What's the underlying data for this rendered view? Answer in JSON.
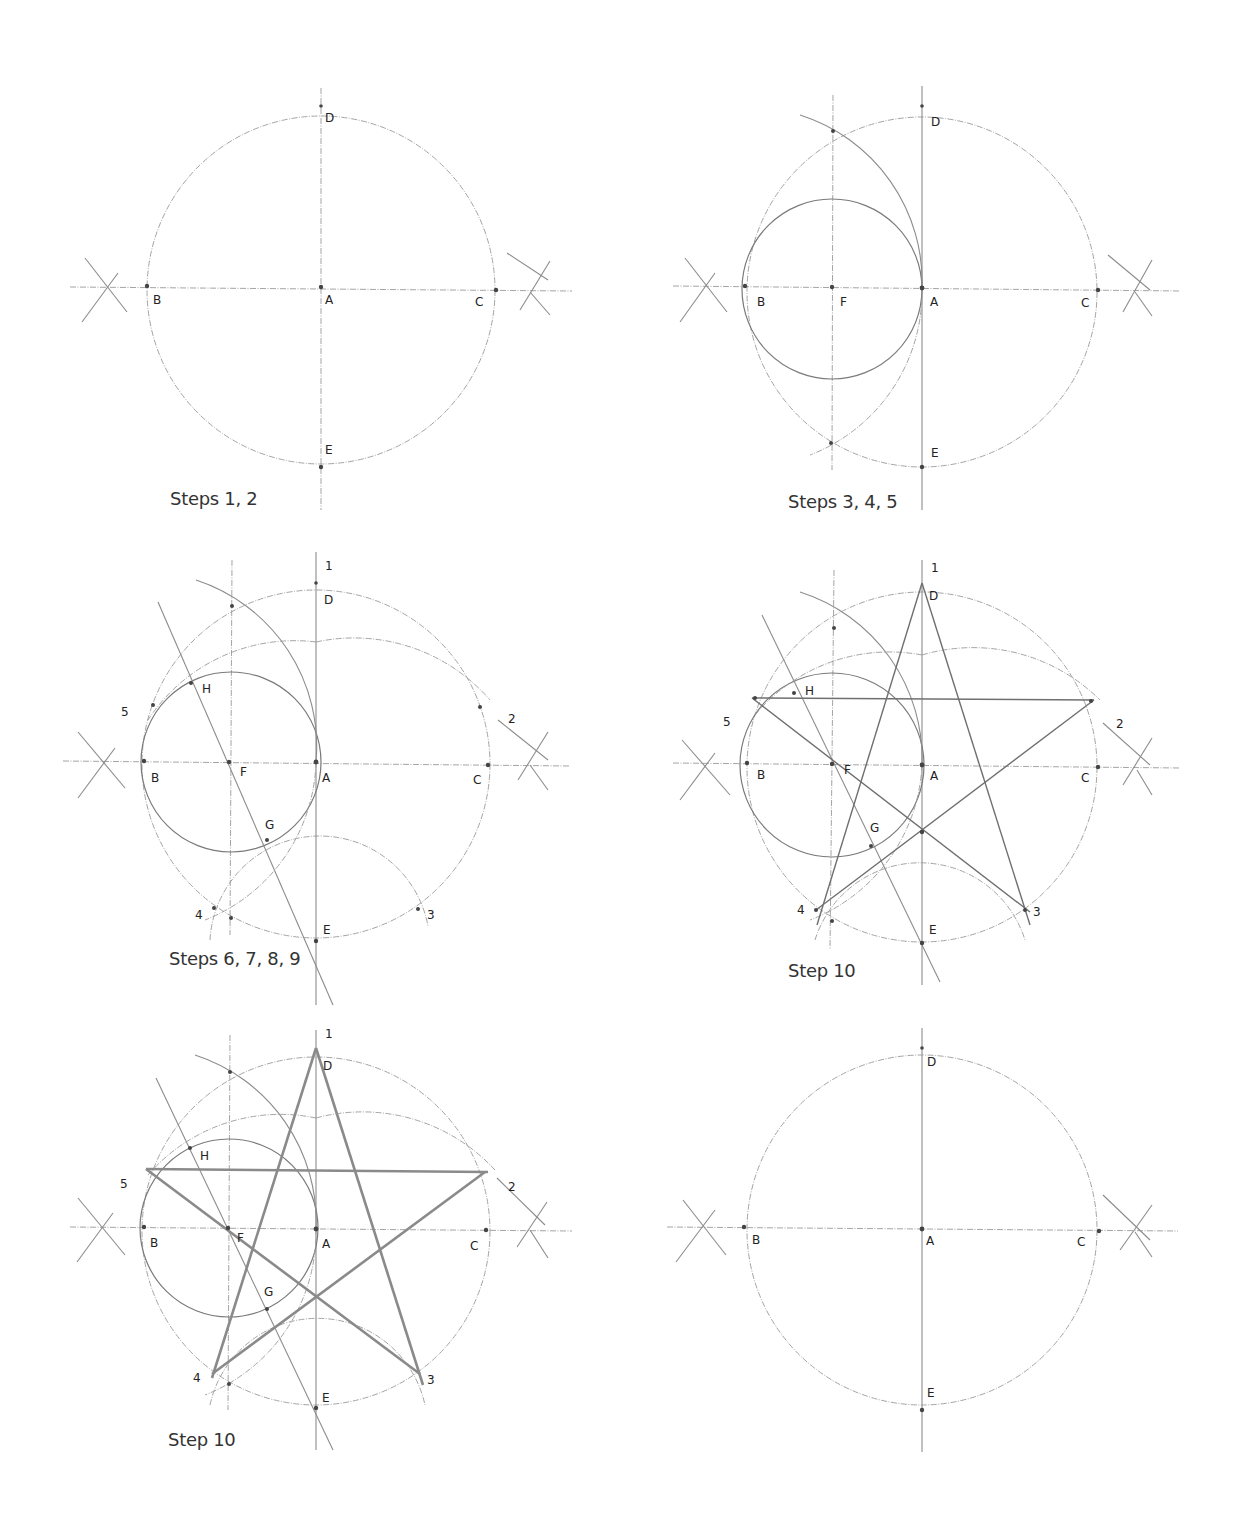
{
  "figure": {
    "panels": [
      {
        "id": "p1",
        "caption": "Steps 1, 2",
        "labels": {
          "A": "A",
          "B": "B",
          "C": "C",
          "D": "D",
          "E": "E"
        }
      },
      {
        "id": "p2",
        "caption": "Steps 3, 4, 5",
        "labels": {
          "A": "A",
          "B": "B",
          "C": "C",
          "D": "D",
          "E": "E",
          "F": "F"
        }
      },
      {
        "id": "p3",
        "caption": "Steps 6, 7, 8, 9",
        "labels": {
          "A": "A",
          "B": "B",
          "C": "C",
          "D": "D",
          "E": "E",
          "F": "F",
          "G": "G",
          "H": "H",
          "n1": "1",
          "n2": "2",
          "n3": "3",
          "n4": "4",
          "n5": "5"
        }
      },
      {
        "id": "p4",
        "caption": "Step 10",
        "labels": {
          "A": "A",
          "B": "B",
          "C": "C",
          "D": "D",
          "E": "E",
          "F": "F",
          "G": "G",
          "H": "H",
          "n1": "1",
          "n2": "2",
          "n3": "3",
          "n4": "4",
          "n5": "5"
        }
      },
      {
        "id": "p5",
        "caption": "Step 10",
        "labels": {
          "A": "A",
          "B": "B",
          "C": "C",
          "D": "D",
          "E": "E",
          "F": "F",
          "G": "G",
          "H": "H",
          "n1": "1",
          "n2": "2",
          "n3": "3",
          "n4": "4",
          "n5": "5"
        }
      },
      {
        "id": "p6",
        "caption": "",
        "labels": {
          "A": "A",
          "B": "B",
          "C": "C",
          "D": "D",
          "E": "E"
        }
      }
    ],
    "colors": {
      "construction_line": "#9a9a9a",
      "star_line": "#6f6f6f",
      "star_bold_line": "#8a8a8a",
      "text": "#222222"
    }
  }
}
